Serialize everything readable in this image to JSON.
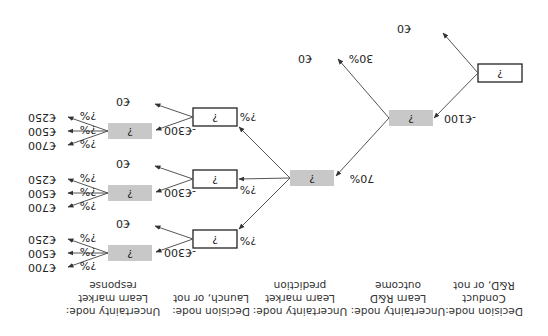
{
  "orientation": "rotated-180",
  "colors": {
    "uncertainty_fill": "#c8c8c8",
    "decision_fill": "#ffffff",
    "edge": "#555555"
  },
  "headers": [
    {
      "lines": [
        "Decision node:",
        "Conduct",
        "R&D, or not"
      ]
    },
    {
      "lines": [
        "Uncertainty node:",
        "Learn R&D",
        "outcome"
      ]
    },
    {
      "lines": [
        "Uncertainty node:",
        "Learn market",
        "prediction"
      ]
    },
    {
      "lines": [
        "Decision node:",
        "Launch, or not"
      ]
    },
    {
      "lines": [
        "Uncertainty node:",
        "Learn market",
        "response"
      ]
    }
  ],
  "nodes": {
    "d1": {
      "type": "decision",
      "label": "?"
    },
    "u1": {
      "type": "uncertainty",
      "label": "?"
    },
    "u2": {
      "type": "uncertainty",
      "label": "?"
    },
    "d2a": {
      "type": "decision",
      "label": "?"
    },
    "d2b": {
      "type": "decision",
      "label": "?"
    },
    "d2c": {
      "type": "decision",
      "label": "?"
    },
    "u3a": {
      "type": "uncertainty",
      "label": "?"
    },
    "u3b": {
      "type": "uncertainty",
      "label": "?"
    },
    "u3c": {
      "type": "uncertainty",
      "label": "?"
    }
  },
  "edges": {
    "d1_no": "€0",
    "d1_yes": "-€100",
    "u1_fail_pct": "30%",
    "u1_fail_val": "€0",
    "u1_success_pct": "70%",
    "u2_pct_a": "?%",
    "u2_pct_b": "?%",
    "u2_pct_c": "?%",
    "d2_no": "€0",
    "d2_yes": "-€300",
    "u3_pcts": [
      "?%",
      "?%",
      "?%"
    ],
    "u3_vals": [
      "€700",
      "€500",
      "€250"
    ]
  }
}
